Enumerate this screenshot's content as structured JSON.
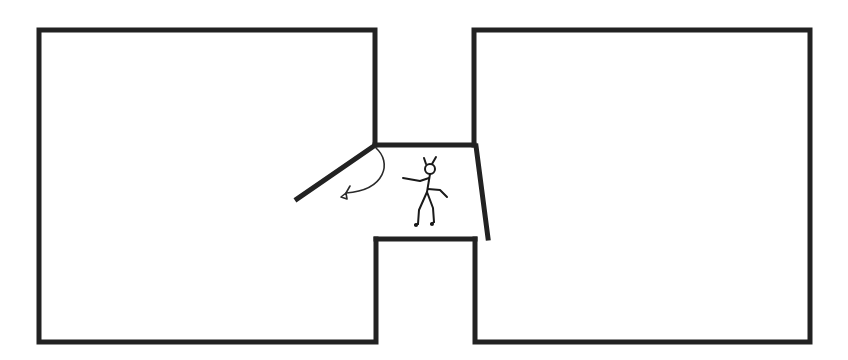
{
  "diagram": {
    "title": "Floor plan: two rooms connected by a corridor with a swinging door",
    "colors": {
      "wall": "#222222",
      "background": "#ffffff",
      "figure": "#1a1a1a"
    },
    "rooms": [
      {
        "id": "left-room",
        "label": "Left room"
      },
      {
        "id": "right-room",
        "label": "Right room"
      }
    ],
    "corridor": {
      "label": "Connecting corridor"
    },
    "door": {
      "label": "Swinging door (opens into left room)",
      "icon": "curved-arrow-icon"
    },
    "person": {
      "label": "Person walking in corridor",
      "icon": "stick-figure-icon"
    },
    "second_door": {
      "label": "Angled door panel at corridor exit"
    }
  }
}
